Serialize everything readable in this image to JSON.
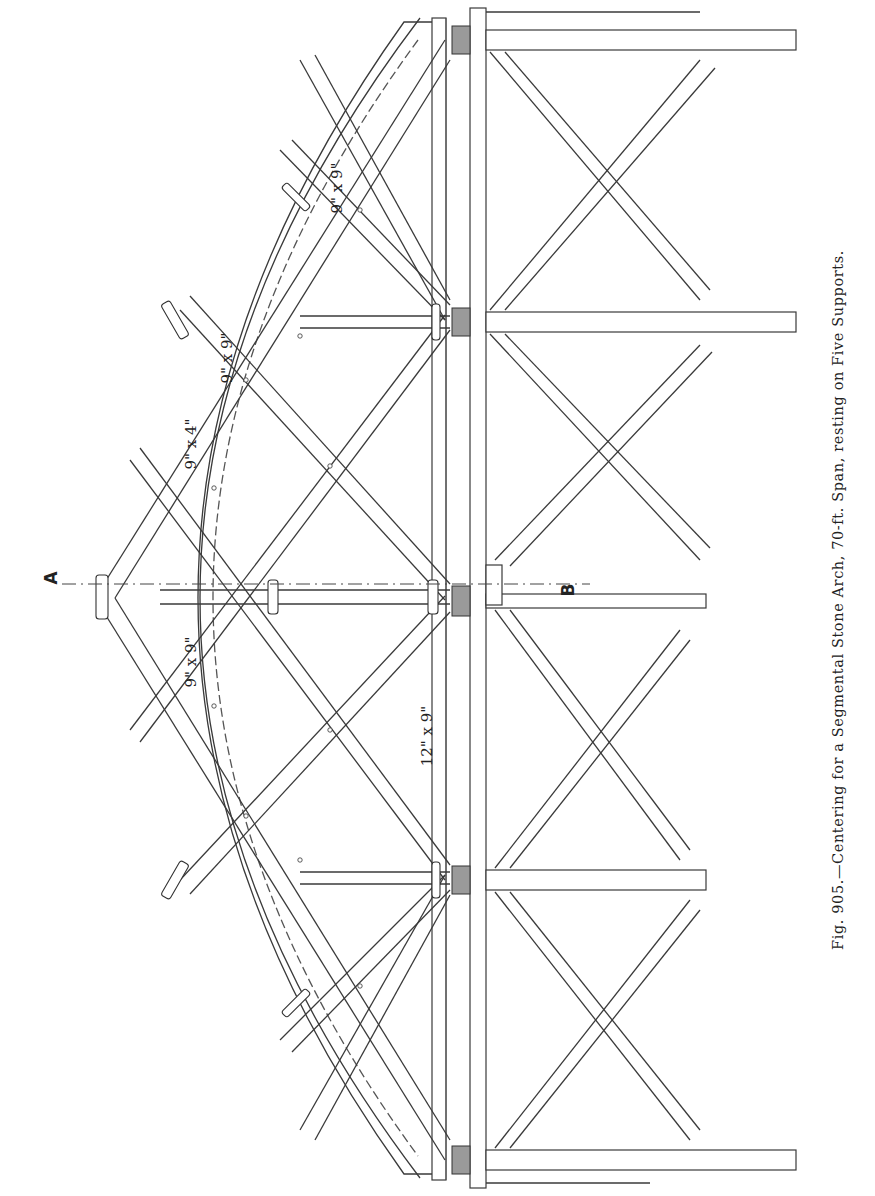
{
  "figure": {
    "number": "Fig. 905.",
    "caption_text": "Centering for a Segmental Stone Arch, 70-ft. Span, resting on Five Supports.",
    "full_caption": "Fig. 905.—Centering for a Segmental Stone Arch, 70-ft. Span, resting on Five Supports.",
    "orientation": "rotated 90° counter-clockwise"
  },
  "section_markers": {
    "start": "A",
    "end": "B"
  },
  "dimension_labels": [
    {
      "id": "rib-strut-upper",
      "text": "9\" x 9\""
    },
    {
      "id": "rib-strut-mid",
      "text": "9\" x 9\""
    },
    {
      "id": "brace",
      "text": "9\" x 4\""
    },
    {
      "id": "crown-post",
      "text": "9\" x 9\""
    },
    {
      "id": "sill",
      "text": "12\" x 9\""
    }
  ],
  "structure": {
    "span": "70-ft.",
    "supports_count": 5,
    "arch_type": "Segmental Stone Arch"
  }
}
